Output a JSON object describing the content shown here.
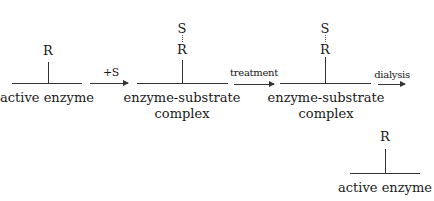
{
  "diagram": {
    "structures": [
      {
        "id": "active-enzyme-1",
        "top_label": "R",
        "caption_lines": [
          "active enzyme"
        ]
      },
      {
        "id": "complex-1",
        "bound_label": "S",
        "top_label": "R",
        "caption_lines": [
          "enzyme-substrate",
          "complex"
        ]
      },
      {
        "id": "complex-2",
        "bound_label": "S",
        "top_label": "R",
        "caption_lines": [
          "enzyme-substrate",
          "complex"
        ]
      },
      {
        "id": "active-enzyme-2",
        "top_label": "R",
        "caption_lines": [
          "active enzyme"
        ]
      }
    ],
    "arrows": [
      {
        "label": "+S"
      },
      {
        "label": "treatment"
      },
      {
        "label": "dialysis"
      }
    ]
  }
}
